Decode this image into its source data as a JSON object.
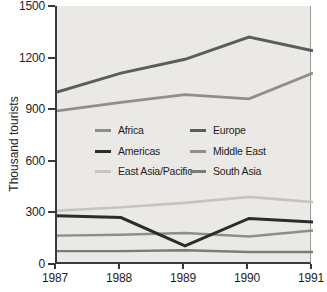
{
  "chart_data": {
    "type": "line",
    "title": "",
    "xlabel": "",
    "ylabel": "Thousand tourists",
    "x_labels": [
      "1987",
      "1988",
      "1989",
      "1990",
      "1991"
    ],
    "ylim": [
      0,
      1500
    ],
    "yticks": [
      0,
      300,
      600,
      900,
      1200,
      1500
    ],
    "grid": false,
    "plot_background": "#ebe9e5",
    "axis_color": "#3a3a3a",
    "right_border_color": "#9a9894",
    "legend_position": "inside-left, two columns",
    "series": [
      {
        "name": "Africa",
        "color": "#8d8d89",
        "width": 2.4,
        "z": 2,
        "values": [
          165,
          170,
          180,
          160,
          195
        ]
      },
      {
        "name": "Americas",
        "color": "#2c2c2b",
        "width": 3.0,
        "z": 6,
        "values": [
          280,
          270,
          105,
          265,
          245
        ]
      },
      {
        "name": "East Asia/Pacific",
        "color": "#c6c4be",
        "width": 2.6,
        "z": 3,
        "values": [
          310,
          330,
          355,
          390,
          360
        ]
      },
      {
        "name": "Europe",
        "color": "#5c5c5a",
        "width": 3.0,
        "z": 5,
        "values": [
          1000,
          1110,
          1190,
          1320,
          1240
        ]
      },
      {
        "name": "Middle East",
        "color": "#908e8a",
        "width": 2.8,
        "z": 4,
        "values": [
          890,
          940,
          985,
          960,
          1110
        ]
      },
      {
        "name": "South Asia",
        "color": "#7b7b78",
        "width": 2.4,
        "z": 1,
        "values": [
          75,
          75,
          80,
          70,
          70
        ]
      }
    ],
    "legend_columns": [
      [
        "Africa",
        "Americas",
        "East Asia/Pacific"
      ],
      [
        "Europe",
        "Middle East",
        "South Asia"
      ]
    ]
  },
  "layout": {
    "plot": {
      "left": 55,
      "top": 6,
      "width": 256,
      "height": 258
    },
    "legend": {
      "col_x": [
        38,
        133
      ],
      "row_y": [
        124,
        145,
        165
      ]
    }
  }
}
